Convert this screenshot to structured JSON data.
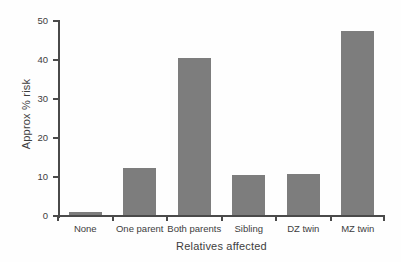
{
  "chart_data": {
    "type": "bar",
    "title": "",
    "xlabel": "Relatives affected",
    "ylabel": "Approx % risk",
    "categories": [
      "None",
      "One parent",
      "Both parents",
      "Sibling",
      "DZ twin",
      "MZ twin"
    ],
    "values": [
      1,
      12.3,
      40.5,
      10.5,
      10.7,
      47.5
    ],
    "ylim": [
      0,
      50
    ],
    "yticks": [
      0,
      10,
      20,
      30,
      40,
      50
    ],
    "ytick_labels": [
      "0",
      "10",
      "20",
      "30",
      "40",
      "50"
    ],
    "grid": false,
    "legend": false,
    "legend_position": "none",
    "bar_color": "#7d7d7d",
    "axis_color": "#4a4a4a",
    "background_color": "#ffffff",
    "text_color": "#3d3d3d"
  }
}
